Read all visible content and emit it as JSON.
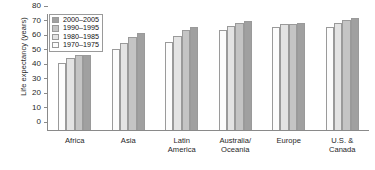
{
  "chart_data": {
    "type": "bar",
    "title": "",
    "xlabel": "",
    "ylabel": "Life expectancy (years)",
    "ylim": [
      0,
      80
    ],
    "yticks": [
      0,
      10,
      20,
      30,
      40,
      50,
      60,
      70,
      80
    ],
    "ytick_labels": [
      "0",
      "10",
      "20",
      "30",
      "40",
      "50",
      "60",
      "70",
      "80"
    ],
    "grid": false,
    "legend_position": "upper-left-inside",
    "categories": [
      "Africa",
      "Asia",
      "Latin\nAmerica",
      "Australia/\nOceania",
      "Europe",
      "U.S. &\nCanada"
    ],
    "series": [
      {
        "name": "1970–1975",
        "color": "#fcfcfc",
        "values": [
          46,
          56,
          61,
          69,
          71,
          71
        ]
      },
      {
        "name": "1980–1985",
        "color": "#e3e3e3",
        "values": [
          50,
          60,
          65,
          72,
          73,
          74
        ]
      },
      {
        "name": "1990–1995",
        "color": "#c4c4c4",
        "values": [
          52,
          64,
          69,
          74,
          73,
          76
        ]
      },
      {
        "name": "2000–2005",
        "color": "#a0a0a0",
        "values": [
          52,
          67,
          71,
          75,
          74,
          77
        ]
      }
    ]
  },
  "legend": {
    "items": [
      {
        "label": "2000–2005",
        "color": "#a0a0a0"
      },
      {
        "label": "1990–1995",
        "color": "#c4c4c4"
      },
      {
        "label": "1980–1985",
        "color": "#e3e3e3"
      },
      {
        "label": "1970–1975",
        "color": "#fcfcfc"
      }
    ]
  },
  "axis": {
    "y_title": "Life expectancy (years)"
  }
}
